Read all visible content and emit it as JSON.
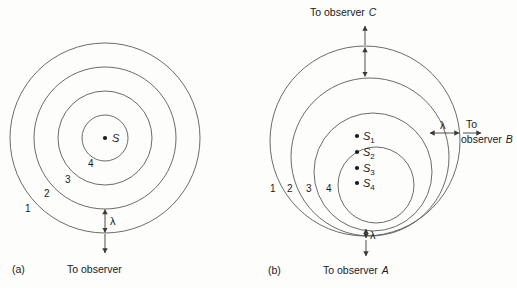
{
  "figure": {
    "type": "doppler-wavefront-diagram",
    "background_color": "#fdfdfc",
    "stroke_color": "#5a5a5a",
    "text_color": "#1a1a1a"
  },
  "panel_a": {
    "caption": "(a)",
    "center_label": "S",
    "wavefront_labels": [
      "1",
      "2",
      "3",
      "4"
    ],
    "wavelength_label": "λ",
    "observer_label": "To  observer",
    "circles": [
      {
        "label": "1",
        "r": 95
      },
      {
        "label": "2",
        "r": 71
      },
      {
        "label": "3",
        "r": 47
      },
      {
        "label": "4",
        "r": 23
      }
    ]
  },
  "panel_b": {
    "caption": "(b)",
    "wavefront_labels": [
      "1",
      "2",
      "3",
      "4"
    ],
    "sources": [
      {
        "label": "S",
        "sub": "1"
      },
      {
        "label": "S",
        "sub": "2"
      },
      {
        "label": "S",
        "sub": "3"
      },
      {
        "label": "S",
        "sub": "4"
      }
    ],
    "wavelength_label_top": "λ",
    "wavelength_label_right": "λ",
    "wavelength_label_bottom": "λ",
    "observer_c_label": "To observer",
    "observer_c_name": "C",
    "observer_b_label_line1": "To",
    "observer_b_label_line2": "observer",
    "observer_b_name": "B",
    "observer_a_label": "To  observer",
    "observer_a_name": "A",
    "circles": [
      {
        "label": "1",
        "r": 95
      },
      {
        "label": "2",
        "r": 79
      },
      {
        "label": "3",
        "r": 59
      },
      {
        "label": "4",
        "r": 38
      }
    ]
  }
}
